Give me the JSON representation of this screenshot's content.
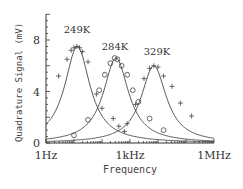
{
  "chart_data": {
    "type": "line",
    "title": "",
    "xlabel": "Frequency",
    "ylabel": "Quadrature Signal (mV)",
    "xscale": "log",
    "xlim_hz": [
      1,
      1000000
    ],
    "ylim": [
      0,
      10
    ],
    "x_ticks": [
      {
        "label": "1Hz",
        "log10": 0
      },
      {
        "label": "1kHz",
        "log10": 3
      },
      {
        "label": "1MHz",
        "log10": 6
      }
    ],
    "y_ticks": [
      {
        "label": "0",
        "value": 0
      },
      {
        "label": "4",
        "value": 4
      },
      {
        "label": "8",
        "value": 8
      }
    ],
    "grid": false,
    "series": [
      {
        "name": "249K",
        "marker": "+",
        "fit": {
          "center_log10": 1.12,
          "peak": 7.5,
          "width_decades": 0.55
        },
        "points_log10f": [
          0.45,
          0.75,
          0.9,
          1.0,
          1.1,
          1.2,
          1.3,
          1.5,
          1.8,
          2.0,
          2.4,
          2.8
        ],
        "points_mV": [
          5.2,
          6.5,
          7.2,
          7.4,
          7.5,
          7.4,
          7.1,
          6.3,
          3.8,
          2.7,
          1.9,
          0.9
        ]
      },
      {
        "name": "284K",
        "marker": "o",
        "fit": {
          "center_log10": 2.5,
          "peak": 6.6,
          "width_decades": 0.55
        },
        "points_log10f": [
          1.0,
          1.5,
          1.9,
          2.1,
          2.3,
          2.45,
          2.55,
          2.7,
          2.9,
          3.1,
          3.3,
          3.7,
          4.2
        ],
        "points_mV": [
          0.6,
          1.8,
          4.1,
          5.3,
          6.2,
          6.6,
          6.5,
          6.0,
          5.3,
          4.1,
          3.2,
          1.9,
          1.0
        ]
      },
      {
        "name": "329K",
        "marker": "+",
        "fit": {
          "center_log10": 3.85,
          "peak": 6.0,
          "width_decades": 0.55
        },
        "points_log10f": [
          2.6,
          2.9,
          3.2,
          3.5,
          3.7,
          3.85,
          4.0,
          4.2,
          4.5,
          4.8,
          5.2
        ],
        "points_mV": [
          1.3,
          1.5,
          3.0,
          5.0,
          5.8,
          6.0,
          5.9,
          5.2,
          4.4,
          3.1,
          2.1
        ]
      }
    ],
    "annotations": [
      "249K",
      "284K",
      "329K"
    ]
  }
}
